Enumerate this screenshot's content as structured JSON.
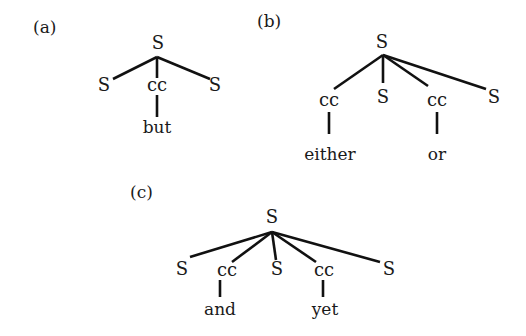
{
  "figure": {
    "panels": [
      {
        "label": "(a)",
        "root": "S",
        "children": [
          "S",
          "cc",
          "S"
        ],
        "leaves": {
          "cc": "but"
        }
      },
      {
        "label": "(b)",
        "root": "S",
        "children": [
          "cc",
          "S",
          "cc",
          "S"
        ],
        "leaves": {
          "cc1": "either",
          "cc2": "or"
        }
      },
      {
        "label": "(c)",
        "root": "S",
        "children": [
          "S",
          "cc",
          "S",
          "cc",
          "S"
        ],
        "leaves": {
          "cc1": "and",
          "cc2": "yet"
        }
      }
    ]
  },
  "a": {
    "label": "(a)",
    "root": "S",
    "c0": "S",
    "c1": "cc",
    "c2": "S",
    "w1": "but"
  },
  "b": {
    "label": "(b)",
    "root": "S",
    "c0": "cc",
    "c1": "S",
    "c2": "cc",
    "c3": "S",
    "w0": "either",
    "w2": "or"
  },
  "c": {
    "label": "(c)",
    "root": "S",
    "c0": "S",
    "c1": "cc",
    "c2": "S",
    "c3": "cc",
    "c4": "S",
    "w1": "and",
    "w3": "yet"
  }
}
